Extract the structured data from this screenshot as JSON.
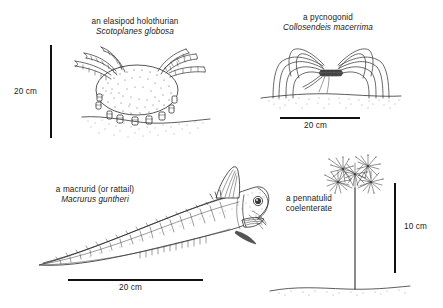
{
  "figure": {
    "background_color": "#ffffff",
    "ink_color": "#2b2b2b"
  },
  "specimens": [
    {
      "id": "holothurian",
      "common_name": "an elasipod holothurian",
      "scientific_name": "Scotoplanes globosa",
      "scale_label": "20 cm",
      "scale_orientation": "vertical"
    },
    {
      "id": "pycnogonid",
      "common_name": "a pycnogonid",
      "scientific_name": "Collosendeis macerrima",
      "scale_label": "20 cm",
      "scale_orientation": "horizontal"
    },
    {
      "id": "macrurid",
      "common_name": "a macrurid (or rattail)",
      "scientific_name": "Macrurus guntheri",
      "scale_label": "20 cm",
      "scale_orientation": "horizontal"
    },
    {
      "id": "pennatulid",
      "common_name": "a pennatulid",
      "common_name_line2": "coelenterate",
      "scientific_name": "",
      "scale_label": "10 cm",
      "scale_orientation": "vertical"
    }
  ]
}
